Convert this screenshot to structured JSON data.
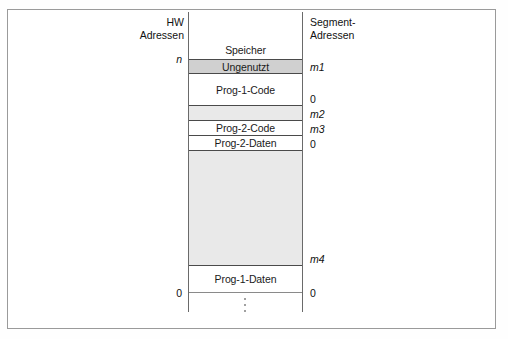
{
  "figure": {
    "left_axis_header": {
      "line1": "HW",
      "line2": "Adressen"
    },
    "right_axis_header": {
      "line1": "Segment-",
      "line2": "Adressen"
    },
    "colors": {
      "band_shaded": "#d0d0d0",
      "band_shaded_light": "#e9e9e9",
      "rule": "#4a4a4a",
      "frame": "#9a9a9a",
      "text": "#111111"
    },
    "bands": [
      {
        "id": "speicher",
        "label": "Speicher",
        "fill": "plain"
      },
      {
        "id": "ungenutzt",
        "label": "Ungenutzt",
        "fill": "shaded"
      },
      {
        "id": "prog1-code",
        "label": "Prog-1-Code",
        "fill": "plain"
      },
      {
        "id": "gap-1",
        "label": "",
        "fill": "shaded-lite"
      },
      {
        "id": "prog2-code",
        "label": "Prog-2-Code",
        "fill": "plain"
      },
      {
        "id": "prog2-daten",
        "label": "Prog-2-Daten",
        "fill": "plain"
      },
      {
        "id": "gap-2",
        "label": "",
        "fill": "shaded-lite"
      },
      {
        "id": "prog1-daten",
        "label": "Prog-1-Daten",
        "fill": "plain"
      }
    ],
    "hw_address_labels": [
      {
        "id": "hw-n",
        "text": "n"
      },
      {
        "id": "hw-0",
        "text": "0"
      }
    ],
    "segment_address_labels": [
      {
        "id": "seg-m1",
        "text": "m1"
      },
      {
        "id": "seg-0-a",
        "text": "0"
      },
      {
        "id": "seg-m2",
        "text": "m2"
      },
      {
        "id": "seg-m3",
        "text": "m3"
      },
      {
        "id": "seg-0-b",
        "text": "0"
      },
      {
        "id": "seg-m4",
        "text": "m4"
      },
      {
        "id": "seg-0-c",
        "text": "0"
      }
    ],
    "ellipsis_marks": [
      {
        "id": "ellipsis-top"
      },
      {
        "id": "ellipsis-bottom"
      }
    ]
  }
}
